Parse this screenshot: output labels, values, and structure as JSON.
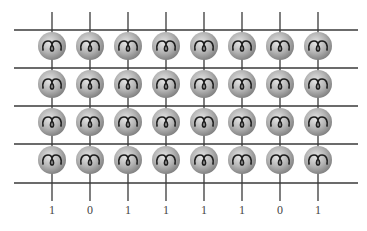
{
  "diagram": {
    "type": "grid-of-spheres",
    "rows": 4,
    "columns": 8,
    "horizontal_lines_y": [
      30,
      68,
      106,
      144,
      183
    ],
    "column_x": [
      52,
      90,
      128,
      166,
      204,
      242,
      280,
      318
    ],
    "row_center_y": [
      46,
      84,
      122,
      160
    ],
    "line_color": "#3a3a3a",
    "sphere_color": "#b8b8b8",
    "bit_labels": [
      "1",
      "0",
      "1",
      "1",
      "1",
      "1",
      "0",
      "1"
    ]
  }
}
